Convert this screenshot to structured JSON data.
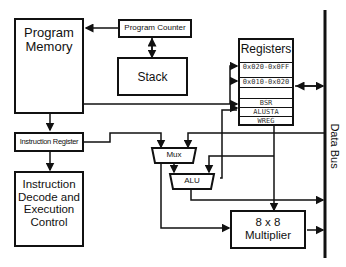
{
  "diagram": {
    "blocks": {
      "program_memory": "Program\nMemory",
      "program_counter": "Program Counter",
      "stack": "Stack",
      "registers": "Registers",
      "instruction_register": "Instruction Register",
      "instruction_decode": "Instruction\nDecode and\nExecution\nControl",
      "mux": "Mux",
      "alu": "ALU",
      "multiplier": "8 x 8\nMultiplier",
      "data_bus": "Data Bus"
    },
    "register_rows": [
      "0x020-0x0FF",
      "0x010-0x020",
      "",
      "BSR",
      "ALUSTA",
      "WREG"
    ],
    "colors": {
      "line": "#111111",
      "background": "#ffffff"
    }
  }
}
